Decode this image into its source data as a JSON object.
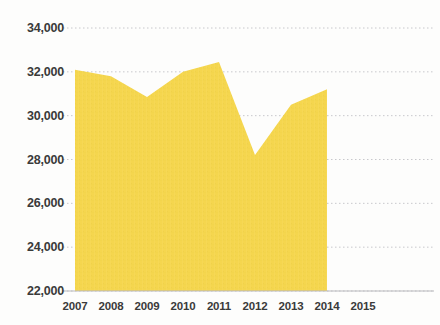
{
  "chart_data": {
    "type": "area",
    "title": "",
    "subtitle": "",
    "xlabel": "",
    "ylabel": "",
    "categories": [
      "2007",
      "2008",
      "2009",
      "2010",
      "2011",
      "2012",
      "2013",
      "2014",
      "2015"
    ],
    "x": [
      2007,
      2008,
      2009,
      2010,
      2011,
      2012,
      2013,
      2014,
      2015
    ],
    "values": [
      32100,
      31800,
      30850,
      32000,
      32450,
      28200,
      30500,
      31200,
      null
    ],
    "series": [
      {
        "name": "series-1",
        "values": [
          32100,
          31800,
          30850,
          32000,
          32450,
          28200,
          30500,
          31200,
          null
        ],
        "color": "#f5d64e"
      }
    ],
    "ylim": [
      22000,
      34000
    ],
    "ytick_values": [
      22000,
      24000,
      26000,
      28000,
      30000,
      32000,
      34000
    ],
    "ytick_labels": [
      "22,000",
      "24,000",
      "26,000",
      "28,000",
      "30,000",
      "32,000",
      "34,000"
    ],
    "xtick_labels": [
      "2007",
      "2008",
      "2009",
      "2010",
      "2011",
      "2012",
      "2013",
      "2014",
      "2015"
    ],
    "grid": true,
    "grid_axis": "y",
    "legend": "none",
    "annotations": []
  },
  "style": {
    "area_fill": "#f5d64e",
    "grid_color": "#c8c8cc",
    "label_color": "#3a3a3a",
    "background": "#fdfdfc"
  }
}
